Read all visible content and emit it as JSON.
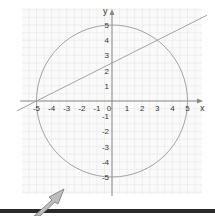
{
  "chart_data": {
    "type": "line",
    "title": "",
    "xlabel": "x",
    "ylabel": "y",
    "xlim": [
      -6,
      6
    ],
    "ylim": [
      -6,
      6
    ],
    "grid": true,
    "x_ticks": [
      "-5",
      "-4",
      "-3",
      "-2",
      "-1",
      "0",
      "1",
      "2",
      "3",
      "4",
      "5"
    ],
    "y_ticks": [
      "5",
      "4",
      "3",
      "2",
      "1",
      "-1",
      "-2",
      "-3",
      "-4",
      "-5"
    ],
    "series": [
      {
        "name": "circle",
        "equation": "x^2 + y^2 = 25",
        "center": [
          0,
          0
        ],
        "radius": 5
      },
      {
        "name": "line",
        "equation": "y = 0.5x + 2.5",
        "slope": 0.5,
        "intercept": 2.5,
        "points": [
          [
            -5,
            0
          ],
          [
            3,
            4
          ]
        ]
      }
    ],
    "intersections": [
      [
        -5,
        0
      ],
      [
        3,
        4
      ]
    ]
  },
  "colors": {
    "grid": "#e6e6e6",
    "axis": "#888888",
    "curve": "#999999",
    "bar": "#2a2a2a",
    "arrow": "#b0b0b0"
  }
}
